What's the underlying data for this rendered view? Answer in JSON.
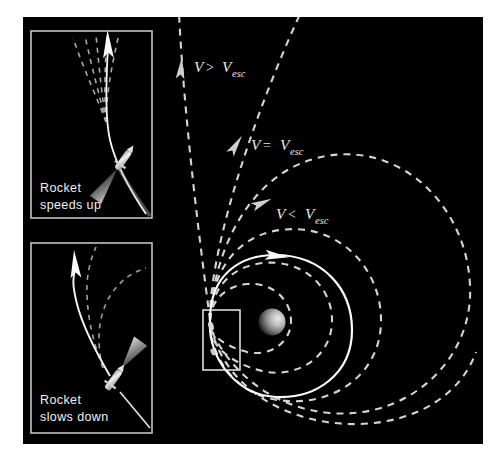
{
  "figure": {
    "name": "escape-velocity-trajectories",
    "page_background": "#ffffff",
    "panel_background": "#000000",
    "panel_border_color": "#b9b9b4",
    "line_color": "#d8d8d4",
    "accent_color": "#ffffff",
    "planet_color": "#b6b6b6"
  },
  "labels": {
    "greater": {
      "v": "V",
      "op": ">",
      "v2": "V",
      "sub": "esc",
      "full": "V > Vesc"
    },
    "equal": {
      "v": "V",
      "op": "=",
      "v2": "V",
      "sub": "esc",
      "full": "V = Vesc"
    },
    "less": {
      "v": "V",
      "op": "<",
      "v2": "V",
      "sub": "esc",
      "full": "V < Vesc"
    }
  },
  "insets": [
    {
      "id": "rocket-speeds-up",
      "caption_line1": "Rocket",
      "caption_line2": "speeds up"
    },
    {
      "id": "rocket-slows-down",
      "caption_line1": "Rocket",
      "caption_line2": "slows down"
    }
  ],
  "objects": {
    "planet_label": "planet",
    "launch_point_label": "launch point",
    "callout_box_label": "detail callout region"
  }
}
